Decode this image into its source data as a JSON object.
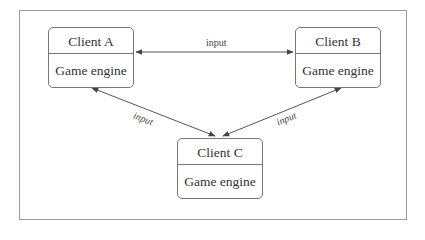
{
  "diagram": {
    "nodes": [
      {
        "id": "A",
        "title": "Client A",
        "body": "Game engine"
      },
      {
        "id": "B",
        "title": "Client B",
        "body": "Game engine"
      },
      {
        "id": "C",
        "title": "Client C",
        "body": "Game engine"
      }
    ],
    "edges": [
      {
        "from": "A",
        "to": "B",
        "label": "input",
        "bidirectional": true
      },
      {
        "from": "A",
        "to": "C",
        "label": "input",
        "bidirectional": true
      },
      {
        "from": "B",
        "to": "C",
        "label": "input",
        "bidirectional": true
      }
    ],
    "colors": {
      "stroke": "#555555",
      "frame": "#9a9a9a",
      "text": "#333333"
    }
  }
}
